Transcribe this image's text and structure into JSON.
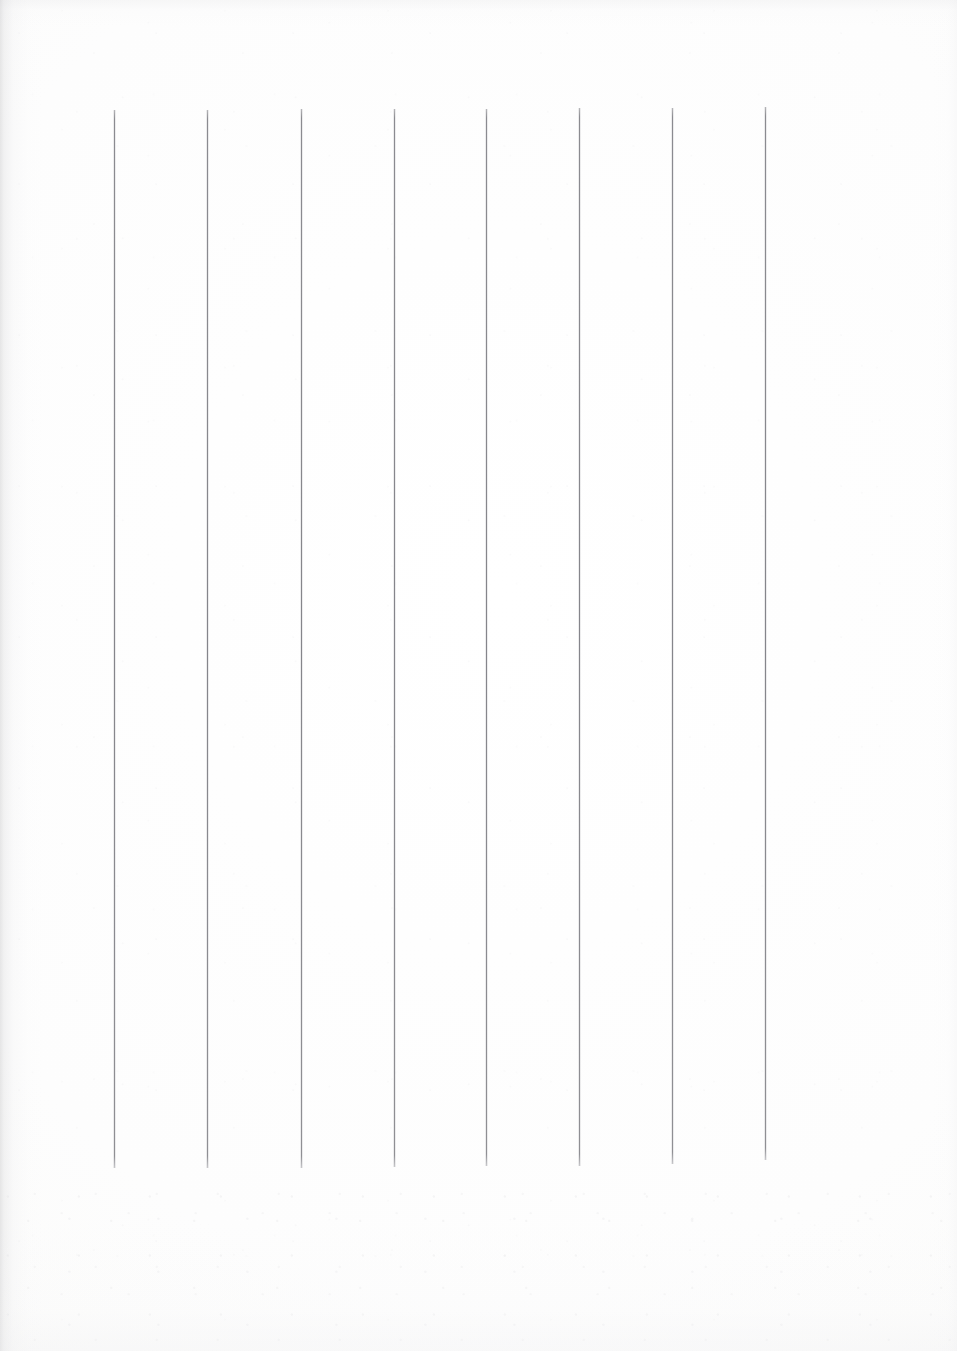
{
  "document": {
    "kind": "scanned-ruled-paper",
    "title": "Blank ruled page",
    "orientation": "portrait",
    "page_width_px": 957,
    "page_height_px": 1351,
    "background_color": "#fefefe",
    "text_content": "",
    "has_text": false,
    "notes": "Empty scanned sheet: only vertical ruling lines are printed; no headings, numbers, captions or handwriting are visible."
  },
  "ruling": {
    "name": "vertical-rules",
    "orientation": "vertical",
    "count": 8,
    "color": "#7d7d82",
    "stroke_width_px": 1,
    "top_y_px": 110,
    "bottom_y_px": 1168,
    "spacing_px": 93.3,
    "left_margin_px": 114,
    "right_margin_px": 765,
    "lines": [
      {
        "index": 1,
        "x": 114,
        "top": 110,
        "bottom": 1168
      },
      {
        "index": 2,
        "x": 207,
        "top": 110,
        "bottom": 1168
      },
      {
        "index": 3,
        "x": 301,
        "top": 109,
        "bottom": 1168
      },
      {
        "index": 4,
        "x": 394,
        "top": 109,
        "bottom": 1167
      },
      {
        "index": 5,
        "x": 486,
        "top": 109,
        "bottom": 1166
      },
      {
        "index": 6,
        "x": 579,
        "top": 108,
        "bottom": 1166
      },
      {
        "index": 7,
        "x": 672,
        "top": 108,
        "bottom": 1164
      },
      {
        "index": 8,
        "x": 765,
        "top": 107,
        "bottom": 1160
      }
    ]
  },
  "columns": {
    "name": "ruled-columns",
    "count": 7,
    "description": "Seven equal writing columns formed between the eight vertical rules."
  },
  "margins": {
    "left_blank_px": 114,
    "right_blank_px": 192,
    "top_blank_px": 110,
    "bottom_blank_px": 183
  },
  "scan_artifacts": {
    "left_edge_shadow": true,
    "paper_speckle": true,
    "speckle_color": "#b2b2b8",
    "edge_shadow_color": "#c4c4c6"
  }
}
